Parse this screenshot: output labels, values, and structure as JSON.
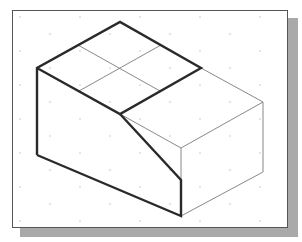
{
  "drawing": {
    "type": "isometric-view",
    "colors": {
      "background": "#ffffff",
      "frame_border": "#555555",
      "frame_shadow": "#a9a9a9",
      "thick_line": "#2a2a2a",
      "thin_line": "#6e6e6e",
      "grid_dot": "#c0c0c0"
    },
    "vertices": {
      "top_apex": [
        120,
        22
      ],
      "left_top": [
        37,
        68
      ],
      "top_right": [
        201,
        68
      ],
      "center_front": [
        120,
        114
      ],
      "left_bottom": [
        37,
        155
      ],
      "front_bottom": [
        181,
        216
      ],
      "far_right_top": [
        263,
        102
      ],
      "far_right_bottom": [
        263,
        172
      ],
      "front_vertical_top": [
        181,
        148
      ]
    }
  }
}
